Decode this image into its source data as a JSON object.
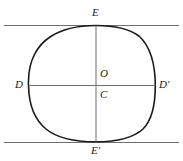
{
  "figure": {
    "labels": {
      "top_tangent_point": "E",
      "bottom_tangent_point": "E'",
      "left_point": "D",
      "right_point": "D'",
      "center_upper": "O",
      "center_lower": "C"
    },
    "colors": {
      "curve": "#1a1a1a",
      "line": "#6e6e6e",
      "chord": "#6e6e6e",
      "label": "#1a1a1a",
      "background": "#ffffff"
    },
    "geometry": {
      "width": 183,
      "height": 161,
      "top_line_y": 25,
      "bottom_line_y": 142,
      "vertical_chord_x": 96,
      "horizontal_chord_y": 85,
      "left_extreme_x": 29,
      "right_extreme_x": 155,
      "curve_path": "M 96 25.5 C 68 26 44 40 33 60 C 25 74 27 84 29 85 C 31 99 38 118 54 130 C 68 140 84 141.5 96 141.5 C 118 141.5 140 133 149 118 C 155 107 155.5 96 155.5 85.5 C 155.5 66 150 46 134 34 C 123 27 110 25.5 96 25.5 Z",
      "top_line_x1": 4,
      "top_line_x2": 179,
      "bottom_line_x1": 4,
      "bottom_line_x2": 179
    }
  }
}
